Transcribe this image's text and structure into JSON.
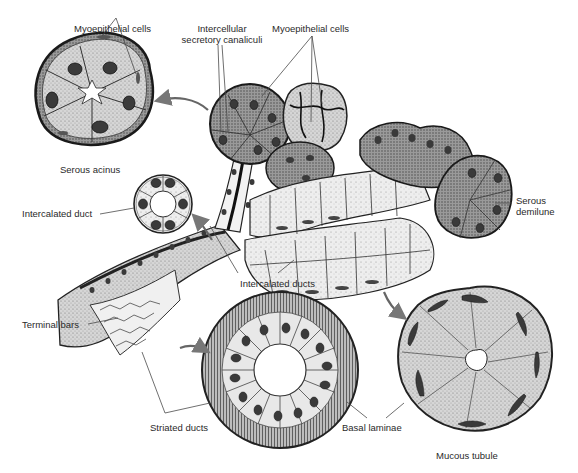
{
  "figure": {
    "colors": {
      "ink": "#1e1e1e",
      "cytoplasm_dark": "#8a8a8a",
      "cytoplasm_mid": "#c4c4c4",
      "cytoplasm_light": "#ececec",
      "nucleus": "#3a3a3a",
      "leader_line": "#4a4a4a",
      "arrow_fill": "#d8d8d8",
      "background": "#ffffff"
    }
  },
  "labels": {
    "myoepithelial_left": "Myoepithelial cells",
    "canaliculi_line1": "Intercellular",
    "canaliculi_line2": "secretory canaliculi",
    "myoepithelial_right": "Myoepithelial cells",
    "serous_acinus": "Serous acinus",
    "intercalated_duct": "Intercalated duct",
    "serous_demilune_line1": "Serous",
    "serous_demilune_line2": "demilune",
    "intercalated_ducts": "Intercalated ducts",
    "terminal_bars": "Terminal bars",
    "striated_ducts": "Striated ducts",
    "basal_laminae": "Basal laminae",
    "mucous_tubule": "Mucous tubule"
  },
  "structures": [
    {
      "name": "serous-acinus-cross-section",
      "cells": 6
    },
    {
      "name": "intercalated-duct-cross-section",
      "cells": 6
    },
    {
      "name": "striated-duct-cross-section",
      "cells": 16
    },
    {
      "name": "mucous-tubule-cross-section",
      "cells": 8
    },
    {
      "name": "branching-gland-3d-view"
    }
  ]
}
